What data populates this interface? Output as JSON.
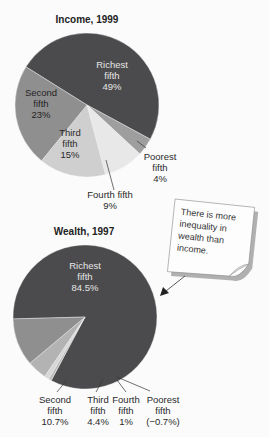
{
  "chart_data": [
    {
      "type": "pie",
      "title": "Income, 1999",
      "unit": "%",
      "slices": [
        {
          "name": "Richest fifth",
          "value": 49,
          "label_lines": [
            "Richest",
            "fifth",
            "49%"
          ],
          "color": "#4b4b4d",
          "text_color": "#e6e6e6"
        },
        {
          "name": "Poorest fifth",
          "value": 4,
          "label_lines": [
            "Poorest",
            "fifth",
            "4%"
          ],
          "color": "#9e9e9e",
          "text_color": "#2a2a2a"
        },
        {
          "name": "Fourth fifth",
          "value": 9,
          "label_lines": [
            "Fourth fifth",
            "9%"
          ],
          "color": "#e8e8e8",
          "text_color": "#2a2a2a"
        },
        {
          "name": "Third fifth",
          "value": 15,
          "label_lines": [
            "Third",
            "fifth",
            "15%"
          ],
          "color": "#cfcfcf",
          "text_color": "#2a2a2a"
        },
        {
          "name": "Second fifth",
          "value": 23,
          "label_lines": [
            "Second",
            "fifth",
            "23%"
          ],
          "color": "#8f8f8f",
          "text_color": "#1f1f1f"
        }
      ]
    },
    {
      "type": "pie",
      "title": "Wealth, 1997",
      "unit": "%",
      "slices": [
        {
          "name": "Richest fifth",
          "value": 84.5,
          "label_lines": [
            "Richest",
            "fifth",
            "84.5%"
          ],
          "color": "#4b4b4d",
          "text_color": "#e6e6e6"
        },
        {
          "name": "Poorest fifth",
          "value": -0.7,
          "label_lines": [
            "Poorest",
            "fifth",
            "(−0.7%)"
          ],
          "color": "#bdbdbd",
          "text_color": "#2a2a2a"
        },
        {
          "name": "Fourth fifth",
          "value": 1,
          "label_lines": [
            "Fourth",
            "fifth",
            "1%"
          ],
          "color": "#d6d6d6",
          "text_color": "#2a2a2a"
        },
        {
          "name": "Third fifth",
          "value": 4.4,
          "label_lines": [
            "Third",
            "fifth",
            "4.4%"
          ],
          "color": "#b3b3b3",
          "text_color": "#2a2a2a"
        },
        {
          "name": "Second fifth",
          "value": 10.7,
          "label_lines": [
            "Second",
            "fifth",
            "10.7%"
          ],
          "color": "#8f8f8f",
          "text_color": "#2a2a2a"
        }
      ]
    }
  ],
  "annotation": {
    "lines": [
      "There is more",
      "inequality in",
      "wealth than",
      "income."
    ]
  }
}
